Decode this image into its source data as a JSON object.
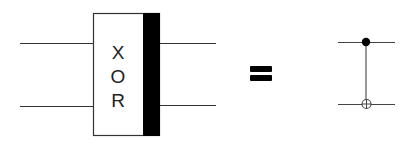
{
  "diagram": {
    "xor_gate": {
      "letters": [
        "X",
        "O",
        "R"
      ],
      "inputs": 2,
      "outputs": 2
    },
    "equals_sign": "=",
    "cnot_gate": {
      "control": "filled-dot",
      "target": "oplus"
    },
    "colors": {
      "line": "#333333",
      "fill_black": "#000000",
      "background": "#ffffff"
    }
  }
}
